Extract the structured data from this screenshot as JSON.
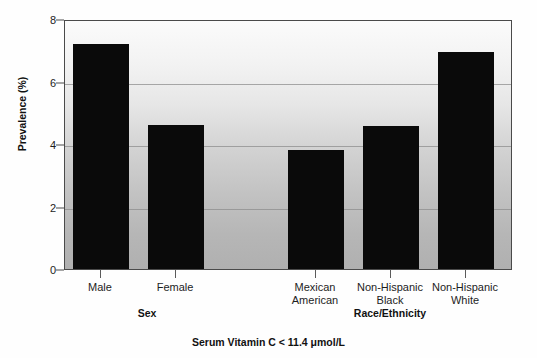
{
  "chart_data": {
    "type": "bar",
    "title": "",
    "caption": "Serum Vitamin C < 11.4 μmol/L",
    "xlabel": "",
    "ylabel": "Prevalence (%)",
    "ylim": [
      0,
      8
    ],
    "yticks": [
      0,
      2,
      4,
      6,
      8
    ],
    "ytick_labels": [
      "0",
      "2",
      "4",
      "6",
      "8"
    ],
    "grid": "horizontal",
    "legend": "none",
    "categories": [
      "Male",
      "Female",
      "Mexican American",
      "Non-Hispanic Black",
      "Non-Hispanic White"
    ],
    "values": [
      7.25,
      4.65,
      3.85,
      4.6,
      7.0
    ],
    "groups": [
      {
        "label": "Sex",
        "categories": [
          "Male",
          "Female"
        ]
      },
      {
        "label": "Race/Ethnicity",
        "categories": [
          "Mexican American",
          "Non-Hispanic Black",
          "Non-Hispanic White"
        ]
      }
    ],
    "bar_color": "#0a0a0a",
    "plot_background": "#d0d0d0",
    "axis_color": "#4a4a4a"
  },
  "axis": {
    "y_title": "Prevalence (%)",
    "ticks": [
      {
        "label": "8",
        "value": 8
      },
      {
        "label": "6",
        "value": 6
      },
      {
        "label": "4",
        "value": 4
      },
      {
        "label": "2",
        "value": 2
      },
      {
        "label": "0",
        "value": 0
      }
    ]
  },
  "xticks": [
    {
      "line1": "Male",
      "line2": ""
    },
    {
      "line1": "Female",
      "line2": ""
    },
    {
      "line1": "Mexican",
      "line2": "American"
    },
    {
      "line1": "Non-Hispanic",
      "line2": "Black"
    },
    {
      "line1": "Non-Hispanic",
      "line2": "White"
    }
  ],
  "group_labels": [
    {
      "text": "Sex"
    },
    {
      "text": "Race/Ethnicity"
    }
  ],
  "caption": {
    "prefix": "Serum Vitamin C",
    "operator": "<",
    "value": "11.4",
    "unit": "μmol/L",
    "full": "Serum Vitamin C < 11.4 μmol/L"
  }
}
